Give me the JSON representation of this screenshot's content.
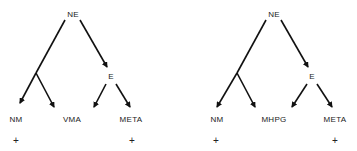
{
  "diagrams": [
    {
      "root": "NE",
      "intermediate": "E",
      "products": [
        "NM",
        "VMA",
        "META"
      ],
      "markers": {
        "NM": "+",
        "META": "+"
      }
    },
    {
      "root": "NE",
      "intermediate": "E",
      "products": [
        "NM",
        "MHPG",
        "META"
      ],
      "markers": {
        "NM": "+",
        "META": "+"
      }
    }
  ],
  "colors": {
    "line": "#111111",
    "text": "#222222",
    "background": "#ffffff"
  }
}
